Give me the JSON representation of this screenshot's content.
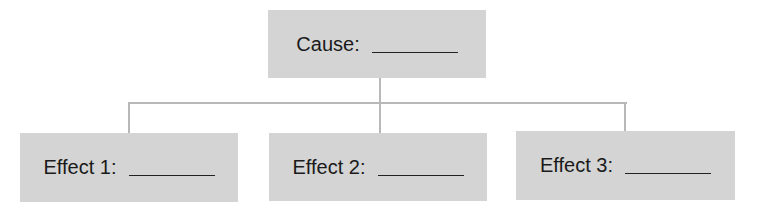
{
  "diagram": {
    "type": "cause-effect",
    "cause": {
      "label": "Cause:",
      "blank": ""
    },
    "effects": [
      {
        "label": "Effect 1:",
        "blank": ""
      },
      {
        "label": "Effect 2:",
        "blank": ""
      },
      {
        "label": "Effect 3:",
        "blank": ""
      }
    ],
    "colors": {
      "box_fill": "#d4d4d4",
      "connector": "#b8b8b8",
      "text": "#1a1a1a"
    }
  }
}
